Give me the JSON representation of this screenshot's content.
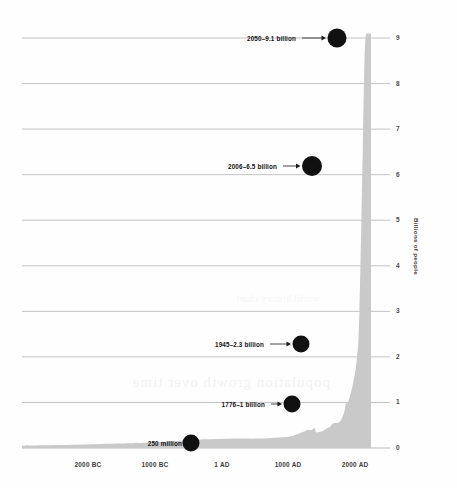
{
  "chart_data": {
    "type": "area",
    "title": "",
    "subtitle": "",
    "xlabel": "",
    "ylabel": "Billions of people",
    "ylim": [
      0,
      9.4
    ],
    "xlim": [
      -2700,
      2120
    ],
    "grid": true,
    "legend": null,
    "fill_color": "#c9c9c9",
    "gridline_color": "#b8b8b8",
    "marker_color": "#111111",
    "y_ticks": [
      "0",
      "1",
      "2",
      "3",
      "4",
      "5",
      "6",
      "7",
      "8",
      "9"
    ],
    "y_tick_values": [
      0,
      1,
      2,
      3,
      4,
      5,
      6,
      7,
      8,
      9
    ],
    "x_ticks": [
      "2000 BC",
      "1000 BC",
      "1 AD",
      "1000 AD",
      "2000 AD"
    ],
    "x_tick_values": [
      -2000,
      -1000,
      1,
      1000,
      2000
    ],
    "series": [
      {
        "name": "World population",
        "units": "billions",
        "x": [
          -2700,
          -2400,
          -2000,
          -1600,
          -1200,
          -1000,
          -800,
          -600,
          -400,
          -200,
          1,
          200,
          400,
          600,
          800,
          1000,
          1100,
          1200,
          1250,
          1300,
          1340,
          1360,
          1400,
          1450,
          1500,
          1550,
          1600,
          1650,
          1700,
          1750,
          1776,
          1800,
          1850,
          1900,
          1927,
          1945,
          1960,
          1974,
          1987,
          1999,
          2006,
          2011,
          2020,
          2030,
          2040,
          2050
        ],
        "y": [
          0.05,
          0.06,
          0.072,
          0.09,
          0.105,
          0.115,
          0.13,
          0.15,
          0.162,
          0.19,
          0.2,
          0.21,
          0.206,
          0.208,
          0.224,
          0.254,
          0.301,
          0.36,
          0.4,
          0.396,
          0.44,
          0.35,
          0.35,
          0.37,
          0.425,
          0.46,
          0.545,
          0.55,
          0.6,
          0.79,
          1.0,
          0.99,
          1.26,
          1.65,
          2.0,
          2.3,
          3.0,
          4.0,
          5.0,
          6.0,
          6.5,
          7.0,
          7.8,
          8.5,
          8.9,
          9.1
        ]
      }
    ],
    "annotations": [
      {
        "id": "a2050",
        "label": "2050–9.1 billion",
        "year": 2050,
        "value": 9.1,
        "has_arrow": true,
        "label_x": 296,
        "dot_x": 337,
        "dot_y": 38,
        "dot_r": 9.5
      },
      {
        "id": "a2006",
        "label": "2006–6.5 billion",
        "year": 2006,
        "value": 6.5,
        "has_arrow": true,
        "label_x": 277,
        "dot_x": 312,
        "dot_y": 166,
        "dot_r": 10
      },
      {
        "id": "a1945",
        "label": "1945–2.3 billion",
        "year": 1945,
        "value": 2.3,
        "has_arrow": true,
        "label_x": 264,
        "dot_x": 301,
        "dot_y": 344,
        "dot_r": 8.5
      },
      {
        "id": "a1776",
        "label": "1776–1 billion",
        "year": 1776,
        "value": 1.0,
        "has_arrow": true,
        "label_x": 265,
        "dot_x": 292,
        "dot_y": 404,
        "dot_r": 8.5
      },
      {
        "id": "a250m",
        "label": "250 million",
        "year": 1,
        "value": 0.25,
        "has_arrow": false,
        "label_x": 182,
        "dot_x": 191,
        "dot_y": 443,
        "dot_r": 8.5
      }
    ]
  },
  "scan_artifacts": {
    "ghost_line_1": "population growth over time",
    "ghost_line_2": "world history chart"
  }
}
